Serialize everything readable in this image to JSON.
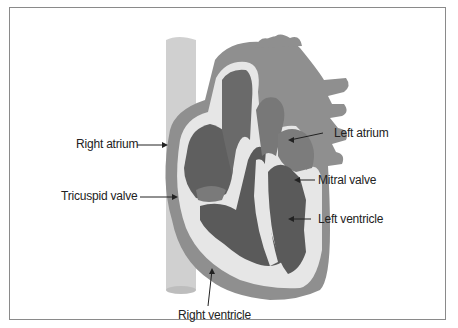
{
  "figure": {
    "colors": {
      "vein": "#cfcfcf",
      "muscle": "#8f8f8f",
      "chamber_dark": "#5f5f5f",
      "chamber_mid": "#777777",
      "septum_light": "#e6e6e6",
      "frame": "#8a8a8a",
      "text": "#222222"
    }
  },
  "labels": {
    "right_atrium": "Right atrium",
    "tricuspid_valve": "Tricuspid valve",
    "right_ventricle": "Right ventricle",
    "left_atrium": "Left atrium",
    "mitral_valve": "Mitral valve",
    "left_ventricle": "Left ventricle"
  }
}
